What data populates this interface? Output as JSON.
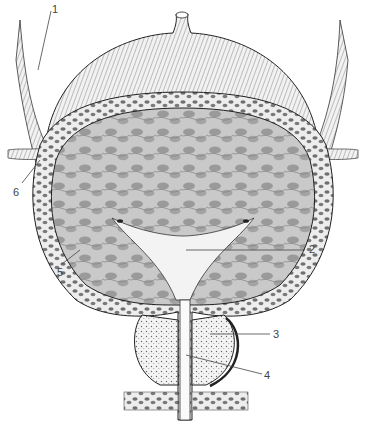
{
  "figure": {
    "type": "anatomical illustration",
    "labels": [
      {
        "id": "1",
        "text": "1",
        "x": 52,
        "y": 6
      },
      {
        "id": "2",
        "text": "2",
        "x": 309,
        "y": 245
      },
      {
        "id": "3",
        "text": "3",
        "x": 273,
        "y": 330
      },
      {
        "id": "4",
        "text": "4",
        "x": 264,
        "y": 371
      },
      {
        "id": "5",
        "text": "5",
        "x": 57,
        "y": 270
      },
      {
        "id": "6",
        "text": "6",
        "x": 13,
        "y": 189
      }
    ]
  },
  "colors": {
    "ink": "#222222",
    "wall_fill": "#e9e9e9",
    "cell_fill": "#6f6f6f",
    "lumen_fill": "#b9b9b9",
    "label": "#444444"
  }
}
